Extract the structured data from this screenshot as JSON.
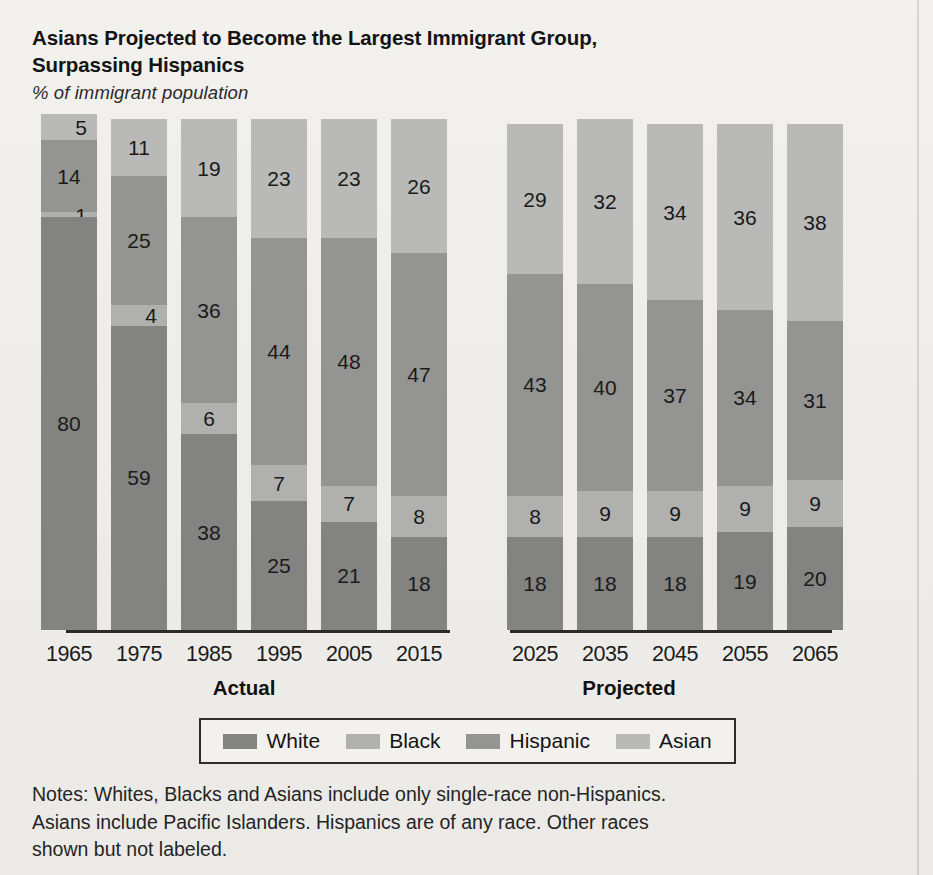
{
  "title": {
    "line1": "Asians Projected to Become the Largest Immigrant Group,",
    "line2": "Surpassing Hispanics"
  },
  "subtitle": "% of immigrant population",
  "groups": {
    "actual": "Actual",
    "projected": "Projected"
  },
  "legend": {
    "items": [
      {
        "label": "White",
        "color": "#838381"
      },
      {
        "label": "Black",
        "color": "#b0b0ae"
      },
      {
        "label": "Hispanic",
        "color": "#949492"
      },
      {
        "label": "Asian",
        "color": "#b9b9b7"
      }
    ]
  },
  "notes": {
    "line1": "Notes: Whites, Blacks and Asians include only single-race non-Hispanics.",
    "line2": "Asians include Pacific Islanders. Hispanics are of any race. Other races",
    "line3": "shown but not labeled."
  },
  "chart_data": {
    "type": "bar",
    "stacked": true,
    "title": "Asians Projected to Become the Largest Immigrant Group, Surpassing Hispanics",
    "subtitle": "% of immigrant population",
    "xlabel": "",
    "ylabel": "% of immigrant population",
    "ylim": [
      0,
      100
    ],
    "grid": false,
    "legend_position": "bottom",
    "categories": [
      "1965",
      "1975",
      "1985",
      "1995",
      "2005",
      "2015",
      "2025",
      "2035",
      "2045",
      "2055",
      "2065"
    ],
    "category_groups": [
      {
        "name": "Actual",
        "categories": [
          "1965",
          "1975",
          "1985",
          "1995",
          "2005",
          "2015"
        ]
      },
      {
        "name": "Projected",
        "categories": [
          "2025",
          "2035",
          "2045",
          "2055",
          "2065"
        ]
      }
    ],
    "stack_order_bottom_to_top": [
      "White",
      "Black",
      "Hispanic",
      "Asian"
    ],
    "series": [
      {
        "name": "White",
        "color": "#838381",
        "values": [
          80,
          59,
          38,
          25,
          21,
          18,
          18,
          18,
          18,
          19,
          20
        ]
      },
      {
        "name": "Black",
        "color": "#b0b0ae",
        "values": [
          1,
          4,
          6,
          7,
          7,
          8,
          8,
          9,
          9,
          9,
          9
        ]
      },
      {
        "name": "Hispanic",
        "color": "#949492",
        "values": [
          14,
          25,
          36,
          44,
          48,
          47,
          43,
          40,
          37,
          34,
          31
        ]
      },
      {
        "name": "Asian",
        "color": "#b9b9b7",
        "values": [
          5,
          11,
          19,
          23,
          23,
          26,
          29,
          32,
          34,
          36,
          38
        ]
      }
    ],
    "annotation": "Other races shown but not labeled."
  },
  "bars": [
    {
      "year": "1965",
      "group": "actual",
      "segments": [
        {
          "cls": "c-asian",
          "name": "Asian",
          "value": 5,
          "label": "5"
        },
        {
          "cls": "c-hispanic",
          "name": "Hispanic",
          "value": 14,
          "label": "14"
        },
        {
          "cls": "c-black",
          "name": "Black",
          "value": 1,
          "label": "1"
        },
        {
          "cls": "c-white",
          "name": "White",
          "value": 80,
          "label": "80"
        }
      ]
    },
    {
      "year": "1975",
      "group": "actual",
      "segments": [
        {
          "cls": "c-asian",
          "name": "Asian",
          "value": 11,
          "label": "11"
        },
        {
          "cls": "c-hispanic",
          "name": "Hispanic",
          "value": 25,
          "label": "25"
        },
        {
          "cls": "c-black",
          "name": "Black",
          "value": 4,
          "label": "4"
        },
        {
          "cls": "c-white",
          "name": "White",
          "value": 59,
          "label": "59"
        }
      ]
    },
    {
      "year": "1985",
      "group": "actual",
      "segments": [
        {
          "cls": "c-asian",
          "name": "Asian",
          "value": 19,
          "label": "19"
        },
        {
          "cls": "c-hispanic",
          "name": "Hispanic",
          "value": 36,
          "label": "36"
        },
        {
          "cls": "c-black",
          "name": "Black",
          "value": 6,
          "label": "6"
        },
        {
          "cls": "c-white",
          "name": "White",
          "value": 38,
          "label": "38"
        }
      ]
    },
    {
      "year": "1995",
      "group": "actual",
      "segments": [
        {
          "cls": "c-asian",
          "name": "Asian",
          "value": 23,
          "label": "23"
        },
        {
          "cls": "c-hispanic",
          "name": "Hispanic",
          "value": 44,
          "label": "44"
        },
        {
          "cls": "c-black",
          "name": "Black",
          "value": 7,
          "label": "7"
        },
        {
          "cls": "c-white",
          "name": "White",
          "value": 25,
          "label": "25"
        }
      ]
    },
    {
      "year": "2005",
      "group": "actual",
      "segments": [
        {
          "cls": "c-asian",
          "name": "Asian",
          "value": 23,
          "label": "23"
        },
        {
          "cls": "c-hispanic",
          "name": "Hispanic",
          "value": 48,
          "label": "48"
        },
        {
          "cls": "c-black",
          "name": "Black",
          "value": 7,
          "label": "7"
        },
        {
          "cls": "c-white",
          "name": "White",
          "value": 21,
          "label": "21"
        }
      ]
    },
    {
      "year": "2015",
      "group": "actual",
      "segments": [
        {
          "cls": "c-asian",
          "name": "Asian",
          "value": 26,
          "label": "26"
        },
        {
          "cls": "c-hispanic",
          "name": "Hispanic",
          "value": 47,
          "label": "47"
        },
        {
          "cls": "c-black",
          "name": "Black",
          "value": 8,
          "label": "8"
        },
        {
          "cls": "c-white",
          "name": "White",
          "value": 18,
          "label": "18"
        }
      ]
    },
    {
      "year": "2025",
      "group": "projected",
      "segments": [
        {
          "cls": "c-asian",
          "name": "Asian",
          "value": 29,
          "label": "29"
        },
        {
          "cls": "c-hispanic",
          "name": "Hispanic",
          "value": 43,
          "label": "43"
        },
        {
          "cls": "c-black",
          "name": "Black",
          "value": 8,
          "label": "8"
        },
        {
          "cls": "c-white",
          "name": "White",
          "value": 18,
          "label": "18"
        }
      ]
    },
    {
      "year": "2035",
      "group": "projected",
      "segments": [
        {
          "cls": "c-asian",
          "name": "Asian",
          "value": 32,
          "label": "32"
        },
        {
          "cls": "c-hispanic",
          "name": "Hispanic",
          "value": 40,
          "label": "40"
        },
        {
          "cls": "c-black",
          "name": "Black",
          "value": 9,
          "label": "9"
        },
        {
          "cls": "c-white",
          "name": "White",
          "value": 18,
          "label": "18"
        }
      ]
    },
    {
      "year": "2045",
      "group": "projected",
      "segments": [
        {
          "cls": "c-asian",
          "name": "Asian",
          "value": 34,
          "label": "34"
        },
        {
          "cls": "c-hispanic",
          "name": "Hispanic",
          "value": 37,
          "label": "37"
        },
        {
          "cls": "c-black",
          "name": "Black",
          "value": 9,
          "label": "9"
        },
        {
          "cls": "c-white",
          "name": "White",
          "value": 18,
          "label": "18"
        }
      ]
    },
    {
      "year": "2055",
      "group": "projected",
      "segments": [
        {
          "cls": "c-asian",
          "name": "Asian",
          "value": 36,
          "label": "36"
        },
        {
          "cls": "c-hispanic",
          "name": "Hispanic",
          "value": 34,
          "label": "34"
        },
        {
          "cls": "c-black",
          "name": "Black",
          "value": 9,
          "label": "9"
        },
        {
          "cls": "c-white",
          "name": "White",
          "value": 19,
          "label": "19"
        }
      ]
    },
    {
      "year": "2065",
      "group": "projected",
      "segments": [
        {
          "cls": "c-asian",
          "name": "Asian",
          "value": 38,
          "label": "38"
        },
        {
          "cls": "c-hispanic",
          "name": "Hispanic",
          "value": 31,
          "label": "31"
        },
        {
          "cls": "c-black",
          "name": "Black",
          "value": 9,
          "label": "9"
        },
        {
          "cls": "c-white",
          "name": "White",
          "value": 20,
          "label": "20"
        }
      ]
    }
  ]
}
